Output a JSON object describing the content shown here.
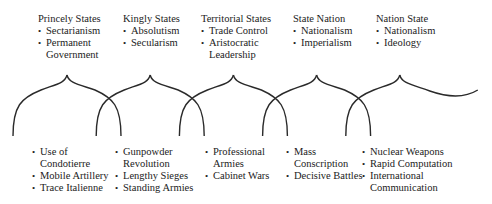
{
  "top": [
    {
      "title": "Princely States",
      "items": [
        "Sectarianism",
        "Permanent\nGovernment"
      ]
    },
    {
      "title": "Kingly States",
      "items": [
        "Absolutism",
        "Secularism"
      ]
    },
    {
      "title": "Territorial States",
      "items": [
        "Trade Control",
        "Aristocratic\nLeadership"
      ]
    },
    {
      "title": "State Nation",
      "items": [
        "Nationalism",
        "Imperialism"
      ]
    },
    {
      "title": "Nation State",
      "items": [
        "Nationalism",
        "Ideology"
      ]
    }
  ],
  "bottom": [
    {
      "items": [
        "Use of\nCondotierre",
        "Mobile Artillery",
        "Trace Italienne"
      ]
    },
    {
      "items": [
        "Gunpowder\nRevolution",
        "Lengthy Sieges",
        "Standing Armies"
      ]
    },
    {
      "items": [
        "Professional\nArmies",
        "Cabinet Wars"
      ]
    },
    {
      "items": [
        "Mass\nConscription",
        "Decisive Battles"
      ]
    },
    {
      "items": [
        "Nuclear Weapons",
        "Rapid Computation",
        "International\nCommunication"
      ]
    }
  ],
  "style": {
    "line_color": "#2a2a2a"
  }
}
